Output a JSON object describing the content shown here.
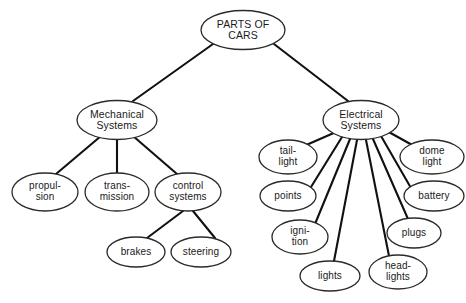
{
  "diagram": {
    "type": "tree",
    "style": {
      "node_shape": "ellipse",
      "line_color": "#111111",
      "node_fill": "#ffffff",
      "node_stroke": "#2a2a2a",
      "background": "#ffffff"
    },
    "nodes": [
      {
        "id": "root",
        "lines": [
          "PARTS OF",
          "CARS"
        ],
        "level": 0,
        "cx": 243,
        "cy": 30,
        "rx": 42,
        "ry": 19.5
      },
      {
        "id": "mechanical",
        "lines": [
          "Mechanical",
          "Systems"
        ],
        "level": 1,
        "cx": 117,
        "cy": 120,
        "rx": 40,
        "ry": 19.5
      },
      {
        "id": "electrical",
        "lines": [
          "Electrical",
          "Systems"
        ],
        "level": 1,
        "cx": 361,
        "cy": 120,
        "rx": 38,
        "ry": 19.5
      },
      {
        "id": "propulsion",
        "lines": [
          "propul-",
          "sion"
        ],
        "level": 2,
        "cx": 45,
        "cy": 192,
        "rx": 33,
        "ry": 19
      },
      {
        "id": "transmission",
        "lines": [
          "trans-",
          "mission"
        ],
        "level": 2,
        "cx": 117,
        "cy": 192,
        "rx": 32,
        "ry": 19
      },
      {
        "id": "control-systems",
        "lines": [
          "control",
          "systems"
        ],
        "level": 2,
        "cx": 188,
        "cy": 192,
        "rx": 33,
        "ry": 19
      },
      {
        "id": "brakes",
        "lines": [
          "brakes"
        ],
        "level": 3,
        "cx": 136,
        "cy": 252,
        "rx": 29,
        "ry": 15
      },
      {
        "id": "steering",
        "lines": [
          "steering"
        ],
        "level": 3,
        "cx": 201,
        "cy": 252,
        "rx": 30,
        "ry": 15
      },
      {
        "id": "tail-light",
        "lines": [
          "tail-",
          "light"
        ],
        "level": 2,
        "cx": 288,
        "cy": 157,
        "rx": 29,
        "ry": 17
      },
      {
        "id": "points",
        "lines": [
          "points"
        ],
        "level": 2,
        "cx": 288,
        "cy": 196,
        "rx": 28,
        "ry": 15
      },
      {
        "id": "ignition",
        "lines": [
          "igni-",
          "tion"
        ],
        "level": 2,
        "cx": 300,
        "cy": 237,
        "rx": 28,
        "ry": 17
      },
      {
        "id": "lights",
        "lines": [
          "lights"
        ],
        "level": 2,
        "cx": 330,
        "cy": 276,
        "rx": 30,
        "ry": 15
      },
      {
        "id": "headlights",
        "lines": [
          "head-",
          "lights"
        ],
        "level": 2,
        "cx": 398,
        "cy": 272,
        "rx": 29,
        "ry": 17
      },
      {
        "id": "plugs",
        "lines": [
          "plugs"
        ],
        "level": 2,
        "cx": 414,
        "cy": 233,
        "rx": 27,
        "ry": 15
      },
      {
        "id": "battery",
        "lines": [
          "battery"
        ],
        "level": 2,
        "cx": 434,
        "cy": 196,
        "rx": 30,
        "ry": 15
      },
      {
        "id": "dome-light",
        "lines": [
          "dome",
          "light"
        ],
        "level": 2,
        "cx": 432,
        "cy": 157,
        "rx": 32,
        "ry": 17
      }
    ],
    "edges": [
      {
        "from": "root",
        "to": "mechanical",
        "x1": 213,
        "y1": 44,
        "x2": 133,
        "y2": 101
      },
      {
        "from": "root",
        "to": "electrical",
        "x1": 274,
        "y1": 44,
        "x2": 348,
        "y2": 101
      },
      {
        "from": "mechanical",
        "to": "propulsion",
        "x1": 101,
        "y1": 136,
        "x2": 56,
        "y2": 174
      },
      {
        "from": "mechanical",
        "to": "transmission",
        "x1": 117,
        "y1": 140,
        "x2": 117,
        "y2": 173
      },
      {
        "from": "mechanical",
        "to": "control-systems",
        "x1": 133,
        "y1": 136,
        "x2": 177,
        "y2": 174
      },
      {
        "from": "control-systems",
        "to": "brakes",
        "x1": 183,
        "y1": 211,
        "x2": 147,
        "y2": 238
      },
      {
        "from": "control-systems",
        "to": "steering",
        "x1": 193,
        "y1": 211,
        "x2": 215,
        "y2": 238
      },
      {
        "from": "electrical",
        "to": "tail-light",
        "x1": 336,
        "y1": 132,
        "x2": 304,
        "y2": 146
      },
      {
        "from": "electrical",
        "to": "points",
        "x1": 342,
        "y1": 137,
        "x2": 311,
        "y2": 187
      },
      {
        "from": "electrical",
        "to": "ignition",
        "x1": 350,
        "y1": 139,
        "x2": 315,
        "y2": 224
      },
      {
        "from": "electrical",
        "to": "lights",
        "x1": 357,
        "y1": 140,
        "x2": 334,
        "y2": 261
      },
      {
        "from": "electrical",
        "to": "headlights",
        "x1": 366,
        "y1": 140,
        "x2": 389,
        "y2": 256
      },
      {
        "from": "electrical",
        "to": "plugs",
        "x1": 373,
        "y1": 139,
        "x2": 408,
        "y2": 219
      },
      {
        "from": "electrical",
        "to": "battery",
        "x1": 381,
        "y1": 136,
        "x2": 411,
        "y2": 188
      },
      {
        "from": "electrical",
        "to": "dome-light",
        "x1": 387,
        "y1": 131,
        "x2": 414,
        "y2": 146
      }
    ]
  }
}
